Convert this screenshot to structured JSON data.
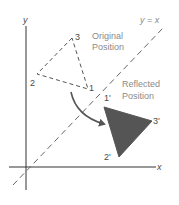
{
  "diagram": {
    "axes": {
      "x_label": "x",
      "y_label": "y"
    },
    "line": {
      "label": "y = x"
    },
    "original": {
      "caption_line1": "Original",
      "caption_line2": "Position",
      "vertices": [
        {
          "label": "1"
        },
        {
          "label": "2"
        },
        {
          "label": "3"
        }
      ],
      "style": "dashed-outline"
    },
    "reflected": {
      "caption_line1": "Reflected",
      "caption_line2": "Position",
      "vertices": [
        {
          "label": "1'"
        },
        {
          "label": "2'"
        },
        {
          "label": "3'"
        }
      ],
      "style": "solid-filled",
      "fill_color": "#555555"
    },
    "arrow": {
      "meaning": "reflection-transform-arrow"
    }
  }
}
